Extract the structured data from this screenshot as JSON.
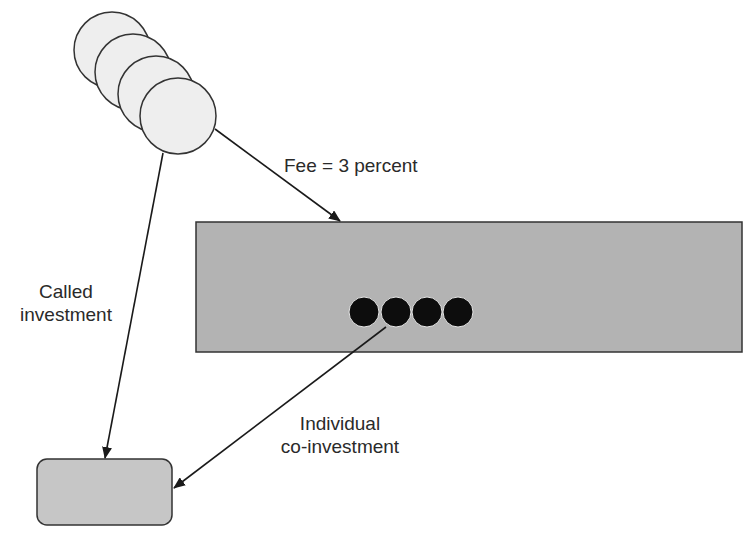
{
  "diagram": {
    "colors": {
      "background": "#ffffff",
      "investor_circle_fill": "#eeeeee",
      "fund_box_fill": "#b3b3b3",
      "partner_dot_fill": "#0d0d0d",
      "target_box_fill": "#c6c6c6",
      "stroke": "#333333"
    },
    "investors": {
      "count": 4,
      "circles": [
        {
          "cx": 112,
          "cy": 50,
          "r": 38
        },
        {
          "cx": 133,
          "cy": 72,
          "r": 38
        },
        {
          "cx": 156,
          "cy": 94,
          "r": 38
        },
        {
          "cx": 178,
          "cy": 116,
          "r": 38
        }
      ]
    },
    "fund_box": {
      "x": 196,
      "y": 222,
      "width": 546,
      "height": 130
    },
    "partners": {
      "count": 4,
      "dots": [
        {
          "cx": 364,
          "cy": 312,
          "r": 15
        },
        {
          "cx": 396,
          "cy": 312,
          "r": 15
        },
        {
          "cx": 427,
          "cy": 312,
          "r": 15
        },
        {
          "cx": 458,
          "cy": 312,
          "r": 15
        }
      ]
    },
    "target_box": {
      "x": 37,
      "y": 459,
      "width": 135,
      "height": 66,
      "rx": 10
    },
    "arrows": [
      {
        "name": "fee",
        "x1": 215,
        "y1": 129,
        "x2": 340,
        "y2": 221
      },
      {
        "name": "called-investment",
        "x1": 163,
        "y1": 153,
        "x2": 105,
        "y2": 458
      },
      {
        "name": "individual-co-investment",
        "x1": 386,
        "y1": 327,
        "x2": 174,
        "y2": 488
      }
    ],
    "labels": {
      "fee": "Fee = 3 percent",
      "called_line1": "Called",
      "called_line2": "investment",
      "coinv_line1": "Individual",
      "coinv_line2": "co-investment"
    }
  }
}
